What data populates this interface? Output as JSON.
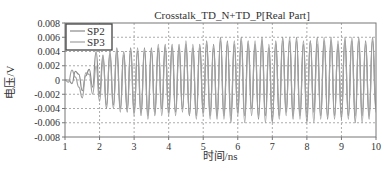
{
  "chart_data": {
    "type": "line",
    "title": "Crosstalk_TD_N+TD_P[Real Part]",
    "xlabel": "时间/ns",
    "ylabel": "电压/V",
    "xlim": [
      1,
      10
    ],
    "ylim": [
      -0.008,
      0.008
    ],
    "x_ticks": [
      1,
      2,
      3,
      4,
      5,
      6,
      7,
      8,
      9,
      10
    ],
    "y_ticks": [
      0.008,
      0.006,
      0.004,
      0.002,
      0,
      -0.002,
      -0.004,
      -0.006,
      -0.008
    ],
    "y_tick_labels": [
      "0.008",
      "0.006",
      "0.004",
      "0.002",
      "0",
      "-0.002",
      "-0.004",
      "-0.006",
      "-0.008"
    ],
    "x_tick_labels": [
      "1",
      "2",
      "3",
      "4",
      "5",
      "6",
      "7",
      "8",
      "9",
      "10"
    ],
    "grid": true,
    "legend_position": "upper-left",
    "series": [
      {
        "name": "SP2",
        "color": "#8a8a8a",
        "x": [
          1.0,
          1.1,
          1.2,
          1.3,
          1.4,
          1.5,
          1.6,
          1.7,
          1.8,
          1.9,
          2.0,
          2.1,
          2.2,
          2.3,
          2.4,
          2.5,
          2.6,
          2.7,
          2.8,
          2.9,
          3.0,
          3.1,
          3.2,
          3.3,
          3.4,
          3.5,
          3.6,
          3.7,
          3.8,
          3.9,
          4.0,
          4.1,
          4.2,
          4.3,
          4.4,
          4.5,
          4.6,
          4.7,
          4.8,
          4.9,
          5.0,
          5.1,
          5.2,
          5.3,
          5.4,
          5.5,
          5.6,
          5.7,
          5.8,
          5.9,
          6.0,
          6.1,
          6.2,
          6.3,
          6.4,
          6.5,
          6.6,
          6.7,
          6.8,
          6.9,
          7.0,
          7.1,
          7.2,
          7.3,
          7.4,
          7.5,
          7.6,
          7.7,
          7.8,
          7.9,
          8.0,
          8.1,
          8.2,
          8.3,
          8.4,
          8.5,
          8.6,
          8.7,
          8.8,
          8.9,
          9.0,
          9.1,
          9.2,
          9.3,
          9.4,
          9.5,
          9.6,
          9.7,
          9.8,
          9.9,
          10.0
        ],
        "values": [
          0,
          0,
          -0.0005,
          0.0012,
          0.0008,
          -0.0015,
          0.0006,
          0.0015,
          -0.001,
          0.004,
          -0.002,
          0.0035,
          -0.004,
          0.004,
          -0.0035,
          0.0045,
          -0.004,
          0.004,
          -0.0045,
          0.0045,
          -0.0045,
          0.004,
          -0.005,
          0.0045,
          -0.005,
          0.0045,
          -0.005,
          0.0045,
          -0.004,
          0.005,
          -0.0045,
          0.005,
          -0.0045,
          0.005,
          -0.004,
          0.005,
          -0.005,
          0.0045,
          -0.005,
          0.005,
          -0.0045,
          0.0055,
          -0.005,
          0.005,
          -0.0055,
          0.006,
          -0.005,
          0.0055,
          -0.006,
          0.005,
          -0.0045,
          0.006,
          -0.005,
          0.0055,
          -0.004,
          0.005,
          -0.0055,
          0.006,
          -0.005,
          0.0045,
          -0.006,
          0.0055,
          -0.005,
          0.006,
          -0.0045,
          0.0055,
          -0.0055,
          0.006,
          -0.005,
          0.005,
          -0.006,
          0.0055,
          -0.0045,
          0.006,
          -0.005,
          0.0055,
          -0.0055,
          0.006,
          -0.005,
          0.005,
          -0.0055,
          0.006,
          -0.005,
          0.0055,
          -0.006,
          0.006,
          -0.005,
          0.0055,
          -0.0055,
          0.006,
          -0.004
        ]
      },
      {
        "name": "SP3",
        "color": "#a0a0a0",
        "x": [
          1.0,
          1.1,
          1.2,
          1.3,
          1.4,
          1.5,
          1.6,
          1.7,
          1.8,
          1.9,
          2.0,
          2.1,
          2.2,
          2.3,
          2.4,
          2.5,
          2.6,
          2.7,
          2.8,
          2.9,
          3.0,
          3.1,
          3.2,
          3.3,
          3.4,
          3.5,
          3.6,
          3.7,
          3.8,
          3.9,
          4.0,
          4.1,
          4.2,
          4.3,
          4.4,
          4.5,
          4.6,
          4.7,
          4.8,
          4.9,
          5.0,
          5.1,
          5.2,
          5.3,
          5.4,
          5.5,
          5.6,
          5.7,
          5.8,
          5.9,
          6.0,
          6.1,
          6.2,
          6.3,
          6.4,
          6.5,
          6.6,
          6.7,
          6.8,
          6.9,
          7.0,
          7.1,
          7.2,
          7.3,
          7.4,
          7.5,
          7.6,
          7.7,
          7.8,
          7.9,
          8.0,
          8.1,
          8.2,
          8.3,
          8.4,
          8.5,
          8.6,
          8.7,
          8.8,
          8.9,
          9.0,
          9.1,
          9.2,
          9.3,
          9.4,
          9.5,
          9.6,
          9.7,
          9.8,
          9.9,
          10.0
        ],
        "values": [
          0,
          -0.0003,
          0.0014,
          0.0004,
          -0.001,
          -0.0025,
          0.001,
          0.0008,
          -0.002,
          0.002,
          -0.003,
          0.003,
          -0.0035,
          0.0035,
          -0.004,
          0.004,
          -0.0045,
          0.0035,
          -0.004,
          0.004,
          -0.005,
          0.0045,
          -0.0045,
          0.004,
          -0.0055,
          0.004,
          -0.0045,
          0.005,
          -0.005,
          0.0045,
          -0.005,
          0.0045,
          -0.005,
          0.0045,
          -0.0045,
          0.0055,
          -0.005,
          0.005,
          -0.0055,
          0.0045,
          -0.005,
          0.005,
          -0.0055,
          0.0045,
          -0.005,
          0.0055,
          -0.0055,
          0.005,
          -0.005,
          0.0055,
          -0.005,
          0.0055,
          -0.006,
          0.005,
          -0.005,
          0.0055,
          -0.005,
          0.0055,
          -0.006,
          0.005,
          -0.0055,
          0.005,
          -0.0055,
          0.0055,
          -0.005,
          0.006,
          -0.005,
          0.0055,
          -0.0055,
          0.0055,
          -0.005,
          0.0055,
          -0.006,
          0.005,
          -0.0055,
          0.006,
          -0.005,
          0.0055,
          -0.0055,
          0.0055,
          -0.005,
          0.0055,
          -0.0055,
          0.006,
          -0.005,
          0.0055,
          -0.006,
          0.005,
          -0.005,
          0.0055,
          -0.0045
        ]
      }
    ]
  },
  "layout": {
    "plot_left": 65,
    "plot_right": 376,
    "plot_top": 23,
    "plot_bottom": 137
  }
}
